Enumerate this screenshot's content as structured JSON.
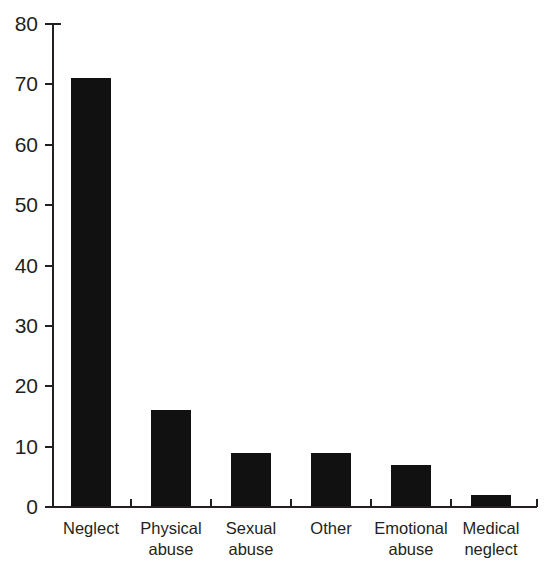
{
  "chart_data": {
    "type": "bar",
    "title": "",
    "subtitle": "",
    "xlabel": "",
    "ylabel": "",
    "categories": [
      "Neglect",
      "Physical abuse",
      "Sexual abuse",
      "Other",
      "Emotional abuse",
      "Medical neglect"
    ],
    "category_lines": [
      [
        "Neglect"
      ],
      [
        "Physical",
        "abuse"
      ],
      [
        "Sexual",
        "abuse"
      ],
      [
        "Other"
      ],
      [
        "Emotional",
        "abuse"
      ],
      [
        "Medical",
        "neglect"
      ]
    ],
    "values": [
      71,
      16,
      9,
      9,
      7,
      2
    ],
    "ylim": [
      0,
      80
    ],
    "ytick_labels": [
      "0",
      "10",
      "20",
      "30",
      "40",
      "50",
      "60",
      "70",
      "80"
    ],
    "ytick_values": [
      0,
      10,
      20,
      30,
      40,
      50,
      60,
      70,
      80
    ],
    "grid": false,
    "legend": "none",
    "bar_color": "#111111",
    "axis_color": "#231f20",
    "background_color": "#ffffff"
  }
}
